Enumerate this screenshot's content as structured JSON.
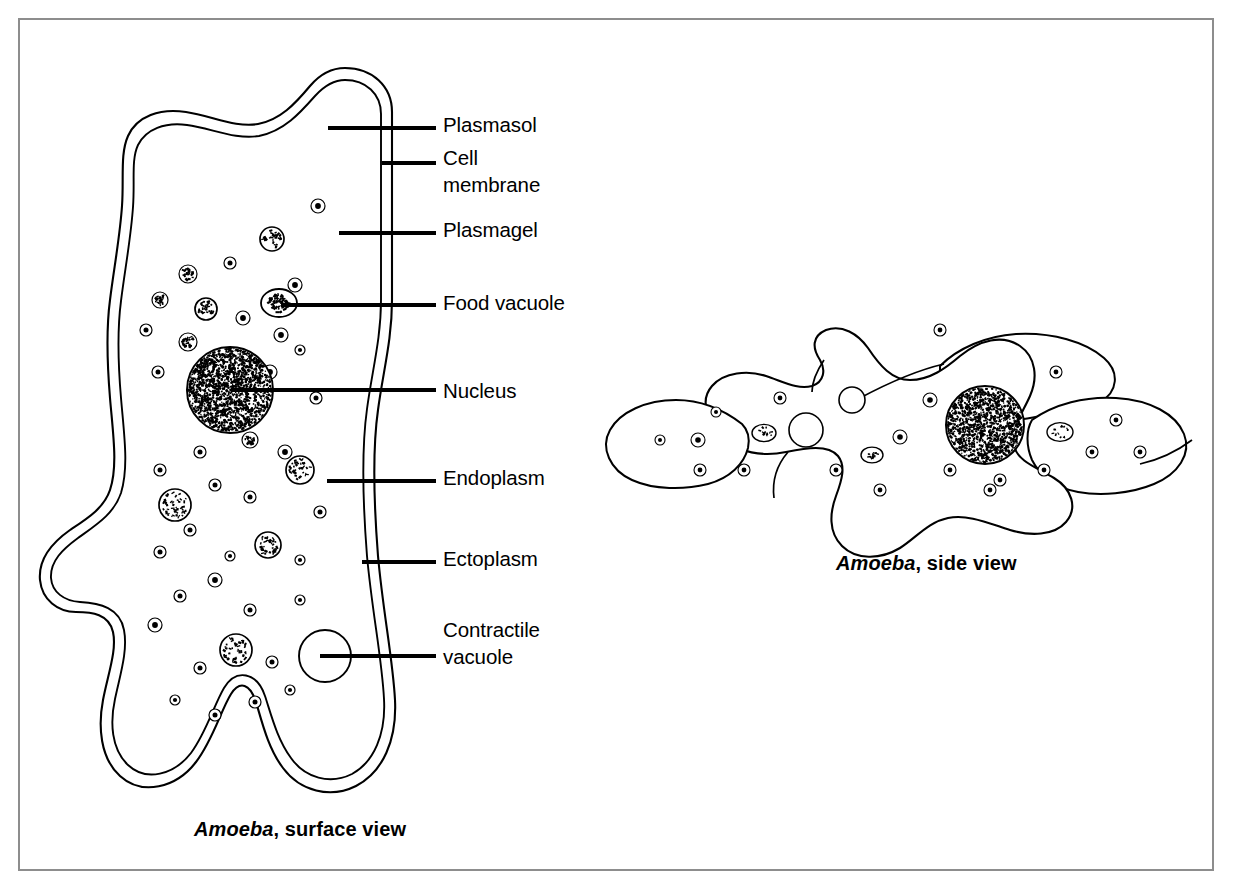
{
  "figure": {
    "background_color": "#ffffff",
    "frame_color": "#8d8d8d",
    "ink_color": "#000000"
  },
  "labels": [
    {
      "id": "plasmasol",
      "text": "Plasmasol",
      "line2": "",
      "x": 443,
      "y": 112
    },
    {
      "id": "cell-membrane",
      "text": "Cell",
      "line2": "membrane",
      "x": 443,
      "y": 145
    },
    {
      "id": "plasmagel",
      "text": "Plasmagel",
      "line2": "",
      "x": 443,
      "y": 217
    },
    {
      "id": "food-vacuole",
      "text": "Food vacuole",
      "line2": "",
      "x": 443,
      "y": 290
    },
    {
      "id": "nucleus",
      "text": "Nucleus",
      "line2": "",
      "x": 443,
      "y": 378
    },
    {
      "id": "endoplasm",
      "text": "Endoplasm",
      "line2": "",
      "x": 443,
      "y": 465
    },
    {
      "id": "ectoplasm",
      "text": "Ectoplasm",
      "line2": "",
      "x": 443,
      "y": 546
    },
    {
      "id": "contractile-vacuole",
      "text": "Contractile",
      "line2": "vacuole",
      "x": 443,
      "y": 617
    }
  ],
  "leaders": [
    {
      "id": "leader-plasmasol",
      "x1": 328,
      "y1": 128,
      "x2": 436,
      "y2": 128
    },
    {
      "id": "leader-cell-membrane",
      "x1": 382,
      "y1": 163,
      "x2": 436,
      "y2": 163
    },
    {
      "id": "leader-plasmagel",
      "x1": 339,
      "y1": 233,
      "x2": 436,
      "y2": 233
    },
    {
      "id": "leader-food-vacuole",
      "x1": 281,
      "y1": 305,
      "x2": 436,
      "y2": 305
    },
    {
      "id": "leader-nucleus",
      "x1": 231,
      "y1": 390,
      "x2": 436,
      "y2": 390
    },
    {
      "id": "leader-endoplasm",
      "x1": 327,
      "y1": 481,
      "x2": 436,
      "y2": 481
    },
    {
      "id": "leader-ectoplasm",
      "x1": 362,
      "y1": 562,
      "x2": 436,
      "y2": 562
    },
    {
      "id": "leader-contractile-vacuole",
      "x1": 320,
      "y1": 656,
      "x2": 436,
      "y2": 656
    }
  ],
  "captions": [
    {
      "id": "caption-surface-view",
      "species": "Amoeba",
      "rest": ", surface view",
      "x": 194,
      "y": 818
    },
    {
      "id": "caption-side-view",
      "species": "Amoeba",
      "rest": ", side view",
      "x": 836,
      "y": 552
    }
  ],
  "organelles": {
    "nucleus": {
      "cx": 230,
      "cy": 390,
      "r": 43
    },
    "contractile_vacuole": {
      "cx": 325,
      "cy": 656,
      "r": 26
    },
    "food_vacuole": {
      "cx": 279,
      "cy": 303,
      "rx": 18,
      "ry": 14
    }
  },
  "chart_data": {
    "type": "diagram",
    "panels": [
      {
        "name": "surface view",
        "caption": "Amoeba, surface view",
        "annotations": [
          "Plasmasol",
          "Cell membrane",
          "Plasmagel",
          "Food vacuole",
          "Nucleus",
          "Endoplasm",
          "Ectoplasm",
          "Contractile vacuole"
        ]
      },
      {
        "name": "side view",
        "caption": "Amoeba, side view",
        "annotations": []
      }
    ]
  }
}
